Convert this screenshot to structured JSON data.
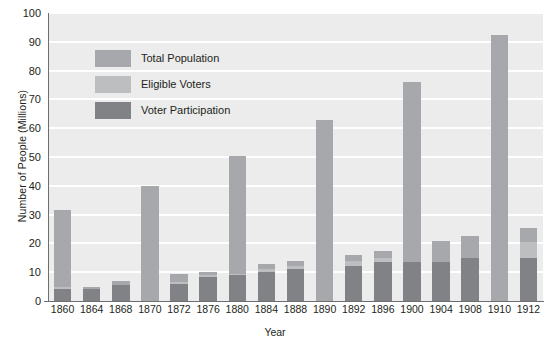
{
  "chart_data": {
    "type": "bar",
    "stacked": true,
    "title": "",
    "xlabel": "Year",
    "ylabel": "Number of People (Millions)",
    "ylim": [
      0,
      100
    ],
    "yticks": [
      0,
      10,
      20,
      30,
      40,
      50,
      60,
      70,
      80,
      90,
      100
    ],
    "grid": true,
    "legend_position": "upper-left-inside",
    "categories": [
      "1860",
      "1864",
      "1868",
      "1870",
      "1872",
      "1876",
      "1880",
      "1884",
      "1888",
      "1890",
      "1892",
      "1896",
      "1900",
      "1904",
      "1908",
      "1910",
      "1912"
    ],
    "series": [
      {
        "name": "Total Population",
        "color": "#a6a8ab",
        "values": [
          31.5,
          5.0,
          7.0,
          40.0,
          9.5,
          10.0,
          50.5,
          13.0,
          14.0,
          63.0,
          16.0,
          17.5,
          76.0,
          21.0,
          22.5,
          92.5,
          25.5
        ]
      },
      {
        "name": "Eligible Voters",
        "color": "#bcbec0",
        "values": [
          5.0,
          4.0,
          5.5,
          0.0,
          6.5,
          9.0,
          9.5,
          11.0,
          12.0,
          0.0,
          14.0,
          15.0,
          13.5,
          13.5,
          15.0,
          0.0,
          20.5
        ]
      },
      {
        "name": "Voter Participation",
        "color": "#808285",
        "values": [
          4.0,
          4.0,
          5.5,
          0.0,
          6.0,
          8.5,
          9.0,
          10.0,
          11.0,
          0.0,
          12.0,
          13.5,
          13.5,
          13.5,
          15.0,
          0.0,
          15.0
        ]
      }
    ]
  },
  "legend": {
    "items": [
      {
        "label": "Total Population",
        "color": "#a6a8ab"
      },
      {
        "label": "Eligible Voters",
        "color": "#bcbec0"
      },
      {
        "label": "Voter Participation",
        "color": "#808285"
      }
    ]
  },
  "colors": {
    "plot_background": "#ececec",
    "gridline": "#ffffff",
    "axis": "#6d6e71",
    "text": "#231f20"
  }
}
